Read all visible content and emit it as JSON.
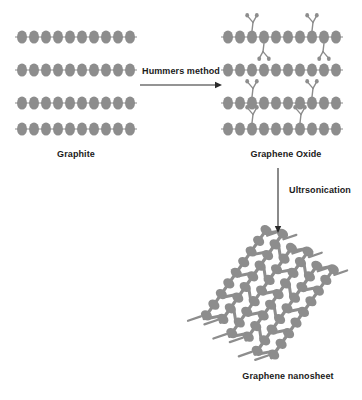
{
  "figure": {
    "background_color": "#ffffff",
    "structure_color": "#8d8d8d",
    "text_color": "#1a1a1a",
    "arrow_color": "#2a2a2a"
  },
  "labels": {
    "graphite": "Graphite",
    "graphene_oxide": "Graphene Oxide",
    "graphene_nanosheet": "Graphene nanosheet",
    "step_one": "Hummers method",
    "step_two": "Ultrsonication"
  },
  "chart_data": {
    "type": "diagram",
    "stages": [
      {
        "id": "graphite",
        "label": "Graphite",
        "description": "Four stacked planar carbon layers, each drawn as a horizontal chain of overlapping ellipses terminated by short bond stubs",
        "layer_count": 4,
        "atoms_per_layer": 10,
        "functional_groups": 0,
        "layer_y": [
          37,
          70,
          103,
          129
        ],
        "x_start": 22,
        "x_end": 130
      },
      {
        "id": "graphene_oxide",
        "label": "Graphene Oxide",
        "description": "Four stacked layers of the same chain motif, now decorated with Y-shaped oxygen functional groups above and below the layers",
        "layer_count": 4,
        "atoms_per_layer": 10,
        "functional_groups": 8,
        "layer_y": [
          37,
          70,
          103,
          129
        ],
        "x_start": 228,
        "x_end": 336,
        "group_placement": [
          {
            "layer": 1,
            "atom_index": 2,
            "direction": "up"
          },
          {
            "layer": 1,
            "atom_index": 7,
            "direction": "up"
          },
          {
            "layer": 1,
            "atom_index": 3,
            "direction": "down"
          },
          {
            "layer": 1,
            "atom_index": 8,
            "direction": "down"
          },
          {
            "layer": 3,
            "atom_index": 2,
            "direction": "up"
          },
          {
            "layer": 3,
            "atom_index": 7,
            "direction": "up"
          },
          {
            "layer": 4,
            "atom_index": 2,
            "direction": "up"
          },
          {
            "layer": 4,
            "atom_index": 6,
            "direction": "up"
          }
        ]
      },
      {
        "id": "graphene_nanosheet",
        "label": "Graphene nanosheet",
        "description": "A single tilted honeycomb lattice sheet of linked carbon ellipses with free bond stubs along the upper-left and lower-right edges",
        "layer_count": 1,
        "rows": 6,
        "atoms_per_row": 9,
        "rotation_degrees": -55,
        "center_x": 268,
        "center_y": 295
      }
    ],
    "transitions": [
      {
        "id": "hummers",
        "label": "Hummers method",
        "from": "graphite",
        "to": "graphene_oxide",
        "direction": "right",
        "arrow_x_start": 140,
        "arrow_x_end": 222,
        "arrow_y": 85
      },
      {
        "id": "ultrasonication",
        "label": "Ultrsonication",
        "from": "graphene_oxide",
        "to": "graphene_nanosheet",
        "direction": "down",
        "arrow_x": 278,
        "arrow_y_start": 168,
        "arrow_y_end": 233
      }
    ],
    "annotations": [
      {
        "text": "Graphite",
        "x": 76,
        "y": 157
      },
      {
        "text": "Graphene Oxide",
        "x": 286,
        "y": 157
      },
      {
        "text": "Hummers method",
        "x": 181,
        "y": 74
      },
      {
        "text": "Ultrsonication",
        "x": 320,
        "y": 193
      },
      {
        "text": "Graphene nanosheet",
        "x": 288,
        "y": 379
      }
    ]
  }
}
